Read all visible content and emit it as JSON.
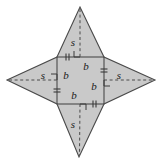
{
  "figure": {
    "colors": {
      "fill": "#c9c9c9",
      "stroke": "#4a4a4a",
      "dashed": "#4a4a4a",
      "label": "#1a1a1a",
      "background": "#ffffff"
    },
    "geometry": {
      "square": {
        "left": 57,
        "top": 57,
        "right": 104,
        "bottom": 104,
        "side_px": 47
      },
      "points": {
        "top_apex": {
          "x": 80,
          "y": 7
        },
        "right_apex": {
          "x": 155,
          "y": 80
        },
        "bottom_apex": {
          "x": 79,
          "y": 157
        },
        "left_apex": {
          "x": 7,
          "y": 80
        }
      }
    },
    "labels": {
      "slant_top": "s",
      "slant_right": "s",
      "slant_bottom": "s",
      "slant_left": "s",
      "base_top": "b",
      "base_right": "b",
      "base_bottom": "b",
      "base_left": "b"
    },
    "marks": {
      "right_angle_count": 4,
      "tick_count": 4,
      "tick_style": "double-hash",
      "dashed_altitudes": 4
    }
  }
}
